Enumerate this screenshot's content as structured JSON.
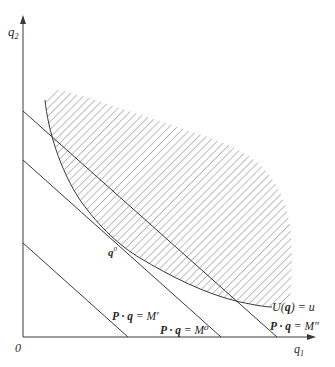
{
  "diagram": {
    "title": "",
    "axes": {
      "x_label": "q",
      "x_label_sub": "1",
      "y_label": "q",
      "y_label_sub": "2",
      "origin_label": "0"
    },
    "budget_lines": [
      {
        "id": "m_prime",
        "label_left": "P · q",
        "label_eq": " = ",
        "label_right": "M′"
      },
      {
        "id": "m_zero",
        "label_left": "P · q",
        "label_eq": " = ",
        "label_right": "M⁰"
      },
      {
        "id": "m_double_prime",
        "label_left": "P · q",
        "label_eq": " = ",
        "label_right": "M″"
      }
    ],
    "indifference_curve": {
      "label": "U(q) = u",
      "label_func": "U(",
      "label_arg": "q",
      "label_rest": ") = u"
    },
    "tangent_point": {
      "label": "q",
      "label_sup": "0"
    },
    "colors": {
      "line": "#3a3a3a",
      "hatch": "#8a8a8a",
      "text": "#2a2a2a",
      "background": "#ffffff"
    }
  }
}
